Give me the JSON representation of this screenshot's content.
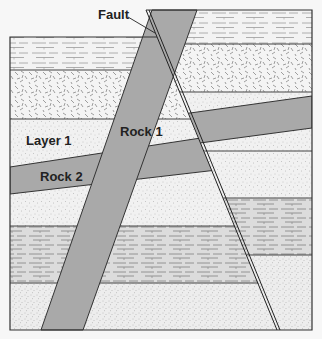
{
  "diagram": {
    "type": "geologic-cross-section",
    "labels": {
      "fault": "Fault",
      "rock1": "Rock 1",
      "rock2": "Rock 2",
      "layer1": "Layer 1"
    },
    "colors": {
      "intrusion": "#a9a9a9",
      "shale": "#d6d6d6",
      "sandstone": "#f1f1f1",
      "outline": "#333333",
      "background": "#f7f7f7"
    }
  }
}
